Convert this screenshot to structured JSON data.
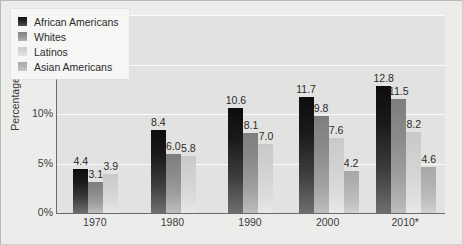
{
  "chart_data": {
    "type": "bar",
    "title": "",
    "xlabel": "",
    "ylabel": "Percentage",
    "ylim": [
      0,
      20
    ],
    "yticks": [
      "0%",
      "5%",
      "10%",
      "15%",
      "20%"
    ],
    "ytick_values": [
      0,
      5,
      10,
      15,
      20
    ],
    "grid": true,
    "legend_position": "upper-left-inside",
    "categories": [
      "1970",
      "1980",
      "1990",
      "2000",
      "2010*"
    ],
    "series": [
      {
        "name": "African Americans",
        "color": "#1a1a1a",
        "values": [
          4.4,
          8.4,
          10.6,
          11.7,
          12.8
        ],
        "labels": [
          "4.4",
          "8.4",
          "10.6",
          "11.7",
          "12.8"
        ]
      },
      {
        "name": "Whites",
        "color": "#969696",
        "values": [
          3.1,
          6.0,
          8.1,
          9.8,
          11.5
        ],
        "labels": [
          "3.1",
          "6.0",
          "8.1",
          "9.8",
          "11.5"
        ]
      },
      {
        "name": "Latinos",
        "color": "#d6d6d4",
        "values": [
          3.9,
          5.8,
          7.0,
          7.6,
          8.2
        ],
        "labels": [
          "3.9",
          "5.8",
          "7.0",
          "7.6",
          "8.2"
        ]
      },
      {
        "name": "Asian Americans",
        "color": "#b4b4b2",
        "values": [
          null,
          null,
          null,
          4.2,
          4.6
        ],
        "labels": [
          null,
          null,
          null,
          "4.2",
          "4.6"
        ]
      }
    ]
  },
  "legend": {
    "items": [
      {
        "label": "African Americans"
      },
      {
        "label": "Whites"
      },
      {
        "label": "Latinos"
      },
      {
        "label": "Asian Americans"
      }
    ]
  }
}
